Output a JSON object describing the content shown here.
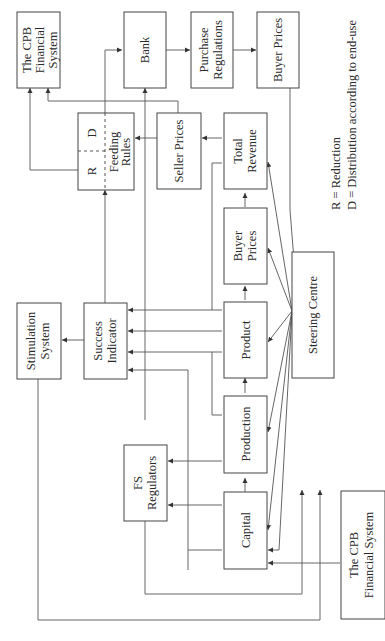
{
  "diagram": {
    "orientation": "rotated-90-ccw",
    "nodes": {
      "cpb_top": {
        "line1": "The CPB",
        "line2": "Financial",
        "line3": "System"
      },
      "bank": {
        "label": "Bank"
      },
      "purchase_regulations": {
        "line1": "Purchase",
        "line2": "Regulations"
      },
      "buyer_prices_top": {
        "label": "Buyer Prices"
      },
      "feeding_rules": {
        "r": "R",
        "d": "D",
        "line1": "Feeding",
        "line2": "Rules"
      },
      "seller_prices": {
        "label": "Seller Prices"
      },
      "total_revenue": {
        "line1": "Total",
        "line2": "Revenue"
      },
      "stimulation_system": {
        "line1": "Stimulation",
        "line2": "System"
      },
      "success_indicator": {
        "line1": "Success",
        "line2": "Indicator"
      },
      "buyer_prices_mid": {
        "line1": "Buyer",
        "line2": "Prices"
      },
      "product": {
        "label": "Product"
      },
      "steering_centre": {
        "label": "Steering Centre"
      },
      "production": {
        "label": "Production"
      },
      "fs_regulators": {
        "line1": "FS",
        "line2": "Regulators"
      },
      "capital": {
        "label": "Capital"
      },
      "cpb_bottom": {
        "line1": "The CPB",
        "line2": "Financial System"
      }
    },
    "legend": {
      "r": "R = Reduction",
      "d": "D = Distribution according to end-use"
    }
  }
}
